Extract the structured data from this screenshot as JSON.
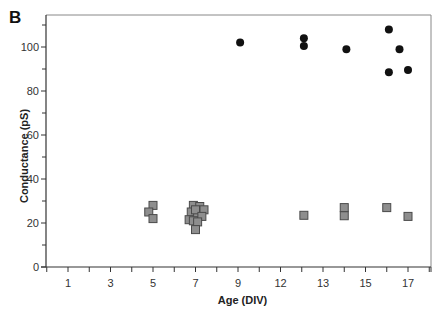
{
  "chart_data": {
    "type": "scatter",
    "panel_label": "B",
    "title": "",
    "xlabel": "Age (DIV)",
    "ylabel": "Conductance (pS)",
    "ylim": [
      0,
      113
    ],
    "yticks": [
      0,
      20,
      40,
      60,
      80,
      100
    ],
    "y_minor_step": 10,
    "xlim": [
      0,
      18
    ],
    "x_tick_positions": [
      1,
      3,
      5,
      7,
      9,
      11,
      13,
      15,
      17
    ],
    "x_tick_labels": [
      "1",
      "3",
      "5",
      "7",
      "9",
      "12",
      "13",
      "15",
      "17"
    ],
    "x_minor_step": 1,
    "grid": false,
    "legend": null,
    "series": [
      {
        "name": "high-conductance",
        "marker": "circle",
        "color": "#111111",
        "points": [
          [
            9.1,
            102
          ],
          [
            12.1,
            104
          ],
          [
            12.1,
            100.5
          ],
          [
            14.1,
            99
          ],
          [
            16.1,
            108
          ],
          [
            16.6,
            99
          ],
          [
            16.1,
            88.5
          ],
          [
            17.0,
            89.6
          ]
        ]
      },
      {
        "name": "low-conductance",
        "marker": "square",
        "color": "#8e8e8e",
        "edge": "#4a4a4a",
        "points": [
          [
            5.0,
            28
          ],
          [
            4.8,
            25
          ],
          [
            5.0,
            22
          ],
          [
            6.9,
            28
          ],
          [
            7.2,
            27.5
          ],
          [
            6.8,
            25
          ],
          [
            7.1,
            24.5
          ],
          [
            7.4,
            26
          ],
          [
            7.0,
            26
          ],
          [
            6.7,
            21.5
          ],
          [
            6.9,
            21
          ],
          [
            7.3,
            23
          ],
          [
            7.1,
            20.5
          ],
          [
            7.0,
            17
          ],
          [
            12.1,
            23.5
          ],
          [
            14.0,
            27
          ],
          [
            14.0,
            23.3
          ],
          [
            16.0,
            27
          ],
          [
            17.0,
            23
          ]
        ]
      }
    ]
  }
}
